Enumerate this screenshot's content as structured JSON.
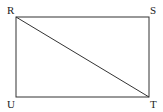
{
  "diagram": {
    "type": "rectangle-with-diagonal",
    "stroke_color": "#333333",
    "vertices": [
      {
        "label": "R",
        "x": 16,
        "y": 17,
        "lx": 7,
        "ly": 14
      },
      {
        "label": "S",
        "x": 149,
        "y": 17,
        "lx": 150,
        "ly": 14
      },
      {
        "label": "T",
        "x": 149,
        "y": 97,
        "lx": 150,
        "ly": 108
      },
      {
        "label": "U",
        "x": 16,
        "y": 97,
        "lx": 7,
        "ly": 108
      }
    ],
    "diagonal": [
      "R",
      "T"
    ]
  }
}
